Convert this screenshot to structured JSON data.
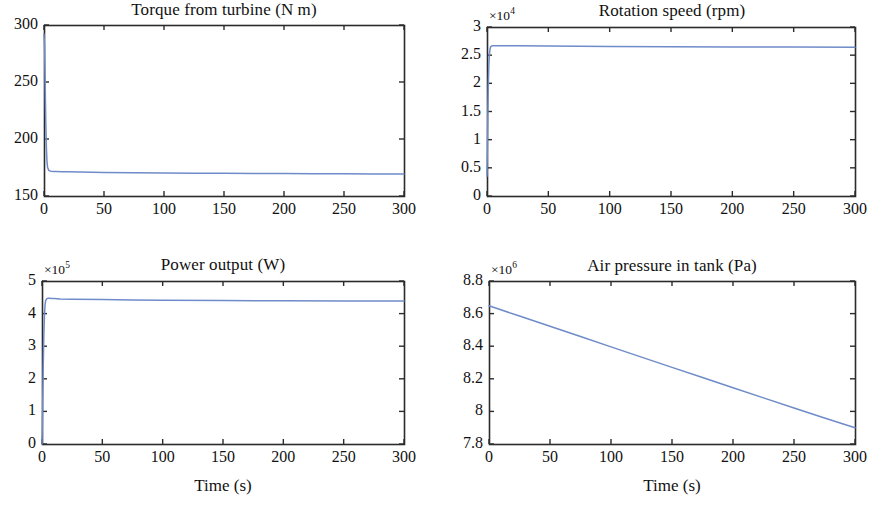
{
  "figure": {
    "background": "#ffffff",
    "line_color": "#6f8bc9",
    "axis_color": "#2b2b2b",
    "width": 870,
    "height": 506
  },
  "chart_data": [
    {
      "type": "line",
      "id": "torque",
      "title": "Torque from turbine (N m)",
      "xlabel": "",
      "ylabel": "",
      "exponent": "",
      "xlim": [
        0,
        300
      ],
      "ylim": [
        150,
        300
      ],
      "xticks": [
        0,
        50,
        100,
        150,
        200,
        250,
        300
      ],
      "xticklabels": [
        "0",
        "50",
        "100",
        "150",
        "200",
        "250",
        "300"
      ],
      "yticks": [
        150,
        200,
        250,
        300
      ],
      "yticklabels": [
        "150",
        "200",
        "250",
        "300"
      ],
      "grid": false,
      "legend": null,
      "series": [
        {
          "name": "Torque",
          "color": "#6f8bc9",
          "x": [
            0,
            0.5,
            1,
            1.5,
            2,
            2.5,
            3,
            4,
            5,
            6,
            8,
            10,
            15,
            20,
            30,
            50,
            75,
            100,
            125,
            150,
            175,
            200,
            225,
            250,
            275,
            290,
            300
          ],
          "y": [
            292,
            281,
            246,
            214,
            192,
            180,
            175,
            172.5,
            172.0,
            171.8,
            171.6,
            171.5,
            171.3,
            171.2,
            171.0,
            170.7,
            170.4,
            170.2,
            170.0,
            169.9,
            169.8,
            169.7,
            169.6,
            169.5,
            169.4,
            169.3,
            169.2
          ]
        }
      ]
    },
    {
      "type": "line",
      "id": "rotation-speed",
      "title": "Rotation speed (rpm)",
      "xlabel": "",
      "ylabel": "",
      "exponent": "×10",
      "exponent_power": "4",
      "xlim": [
        0,
        300
      ],
      "ylim": [
        0,
        30000
      ],
      "xticks": [
        0,
        50,
        100,
        150,
        200,
        250,
        300
      ],
      "xticklabels": [
        "0",
        "50",
        "100",
        "150",
        "200",
        "250",
        "300"
      ],
      "yticks": [
        0,
        5000,
        10000,
        15000,
        20000,
        25000,
        30000
      ],
      "yticklabels": [
        "0",
        "0.5",
        "1",
        "1.5",
        "2",
        "2.5",
        "3"
      ],
      "grid": false,
      "legend": null,
      "series": [
        {
          "name": "Rotation speed",
          "color": "#6f8bc9",
          "x": [
            0,
            0.5,
            1,
            1.5,
            2,
            2.5,
            3,
            4,
            5,
            6,
            8,
            10,
            15,
            25,
            50,
            75,
            100,
            150,
            200,
            250,
            300
          ],
          "y": [
            3500,
            12000,
            19000,
            23200,
            25200,
            26100,
            26500,
            26650,
            26680,
            26690,
            26690,
            26680,
            26670,
            26650,
            26620,
            26590,
            26560,
            26510,
            26470,
            26430,
            26390
          ]
        }
      ]
    },
    {
      "type": "line",
      "id": "power-output",
      "title": "Power output (W)",
      "xlabel": "Time (s)",
      "ylabel": "",
      "exponent": "×10",
      "exponent_power": "5",
      "xlim": [
        0,
        300
      ],
      "ylim": [
        0,
        500000
      ],
      "xticks": [
        0,
        50,
        100,
        150,
        200,
        250,
        300
      ],
      "xticklabels": [
        "0",
        "50",
        "100",
        "150",
        "200",
        "250",
        "300"
      ],
      "yticks": [
        0,
        100000,
        200000,
        300000,
        400000,
        500000
      ],
      "yticklabels": [
        "0",
        "1",
        "2",
        "3",
        "4",
        "5"
      ],
      "grid": false,
      "legend": null,
      "series": [
        {
          "name": "Power output",
          "color": "#6f8bc9",
          "x": [
            0,
            0.5,
            1,
            1.5,
            2,
            2.5,
            3,
            4,
            5,
            6,
            8,
            10,
            15,
            25,
            50,
            75,
            100,
            150,
            200,
            250,
            300
          ],
          "y": [
            0,
            105000,
            235000,
            330000,
            392000,
            425000,
            440000,
            446000,
            447000,
            447000,
            446500,
            446000,
            445000,
            444000,
            443000,
            442000,
            441000,
            440000,
            439500,
            439000,
            438500
          ]
        }
      ]
    },
    {
      "type": "line",
      "id": "air-pressure",
      "title": "Air pressure in tank (Pa)",
      "xlabel": "Time (s)",
      "ylabel": "",
      "exponent": "×10",
      "exponent_power": "6",
      "xlim": [
        0,
        300
      ],
      "ylim": [
        7800000,
        8800000
      ],
      "xticks": [
        0,
        50,
        100,
        150,
        200,
        250,
        300
      ],
      "xticklabels": [
        "0",
        "50",
        "100",
        "150",
        "200",
        "250",
        "300"
      ],
      "yticks": [
        7800000,
        8000000,
        8200000,
        8400000,
        8600000,
        8800000
      ],
      "yticklabels": [
        "7.8",
        "8",
        "8.2",
        "8.4",
        "8.6",
        "8.8"
      ],
      "grid": false,
      "legend": null,
      "series": [
        {
          "name": "Air pressure in tank",
          "color": "#6f8bc9",
          "x": [
            0,
            25,
            50,
            75,
            100,
            125,
            150,
            175,
            200,
            225,
            250,
            275,
            300
          ],
          "y": [
            8648000,
            8585000,
            8522000,
            8459000,
            8396000,
            8333000,
            8270000,
            8208000,
            8145000,
            8083000,
            8021000,
            7960000,
            7900000
          ]
        }
      ]
    }
  ]
}
